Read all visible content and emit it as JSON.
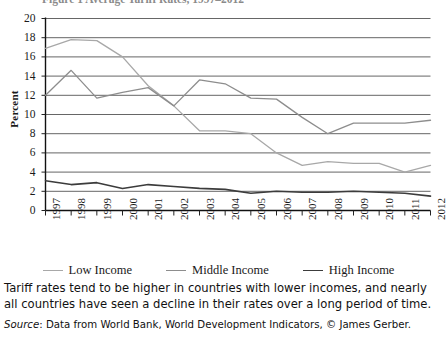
{
  "figure": {
    "title": "Figure 1   Average Tariff Rates, 1997–2012"
  },
  "chart_data": {
    "type": "line",
    "title": "Average Tariff Rates, 1997–2012",
    "xlabel": "",
    "ylabel": "Percent",
    "ylim": [
      0,
      20
    ],
    "ytick_step": 2,
    "grid": true,
    "legend_position": "bottom",
    "categories": [
      "1997",
      "1998",
      "1999",
      "2000",
      "2001",
      "2002",
      "2003",
      "2004",
      "2005",
      "2006",
      "2007",
      "2008",
      "2009",
      "2010",
      "2011",
      "2012"
    ],
    "yticks": [
      "0",
      "2",
      "4",
      "6",
      "8",
      "10",
      "12",
      "14",
      "16",
      "18",
      "20"
    ],
    "series": [
      {
        "name": "Low Income",
        "color": "#a8a8a8",
        "values": [
          16.9,
          17.8,
          17.7,
          16.0,
          13.0,
          10.9,
          8.3,
          8.3,
          8.0,
          6.0,
          4.7,
          5.1,
          4.9,
          4.9,
          4.0,
          4.7
        ]
      },
      {
        "name": "Middle Income",
        "color": "#8d8d8d",
        "values": [
          12.0,
          14.6,
          11.7,
          12.3,
          12.8,
          10.9,
          13.6,
          13.2,
          11.7,
          11.6,
          9.7,
          8.0,
          9.1,
          9.1,
          9.1,
          9.4
        ]
      },
      {
        "name": "High Income",
        "color": "#3c3c3c",
        "values": [
          3.1,
          2.7,
          2.9,
          2.3,
          2.7,
          2.5,
          2.3,
          2.2,
          1.8,
          2.0,
          1.9,
          1.9,
          2.0,
          1.9,
          1.8,
          1.5
        ]
      }
    ]
  },
  "caption": {
    "text": "Tariff rates tend to be higher in countries with lower incomes, and nearly all countries have seen a decline in their rates over a long period of time.",
    "source_label": "Source",
    "source_text": ": Data from World Bank, World Development Indicators, © James Gerber."
  }
}
